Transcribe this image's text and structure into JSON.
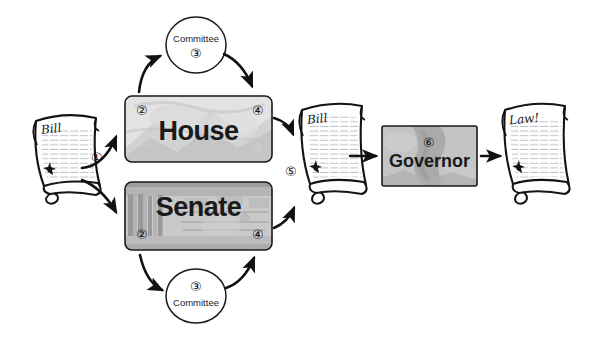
{
  "diagram": {
    "background": "#ffffff",
    "ink": "#111111"
  },
  "documents": [
    {
      "id": "bill-start",
      "name": "bill-scroll-start",
      "title": "Bill",
      "x": 30,
      "y": 110,
      "width": 72,
      "height": 82
    },
    {
      "id": "bill-middle",
      "name": "bill-scroll-middle",
      "title": "Bill",
      "marker": "⑤",
      "marker_value": "5",
      "x": 296,
      "y": 100,
      "width": 72,
      "height": 96
    },
    {
      "id": "law-final",
      "name": "law-scroll-final",
      "title": "Law!",
      "x": 498,
      "y": 100,
      "width": 74,
      "height": 96
    }
  ],
  "chambers": [
    {
      "id": "house",
      "label": "House",
      "marker_left": "②",
      "marker_right": "④",
      "marker_left_value": "2",
      "marker_right_value": "4",
      "marker_position": "top",
      "x": 125,
      "y": 96,
      "width": 147,
      "height": 66,
      "fill": "#d6d6d6"
    },
    {
      "id": "senate",
      "label": "Senate",
      "marker_left": "②",
      "marker_right": "④",
      "marker_left_value": "2",
      "marker_right_value": "4",
      "marker_position": "bottom",
      "x": 125,
      "y": 182,
      "width": 147,
      "height": 68,
      "fill": "#bdbdbd"
    }
  ],
  "committees": [
    {
      "id": "committee-house",
      "label": "Committee",
      "marker": "③",
      "marker_value": "3",
      "order": "label-then-marker",
      "cx": 196,
      "cy": 45,
      "rx": 30,
      "ry": 28
    },
    {
      "id": "committee-senate",
      "label": "Committee",
      "marker": "③",
      "marker_value": "3",
      "order": "marker-then-label",
      "cx": 196,
      "cy": 296,
      "rx": 30,
      "ry": 27
    }
  ],
  "executive": {
    "id": "governor",
    "label": "Governor",
    "marker": "⑥",
    "marker_value": "6",
    "x": 382,
    "y": 126,
    "width": 95,
    "height": 60,
    "fill": "#b9b9b9"
  },
  "steps": [
    {
      "number": "①",
      "value": "1",
      "x": 96,
      "y": 157,
      "desc": "bill introduced"
    }
  ],
  "flow_order": [
    "Bill",
    "House",
    "Committee",
    "House",
    "Bill",
    "Governor",
    "Law!"
  ]
}
